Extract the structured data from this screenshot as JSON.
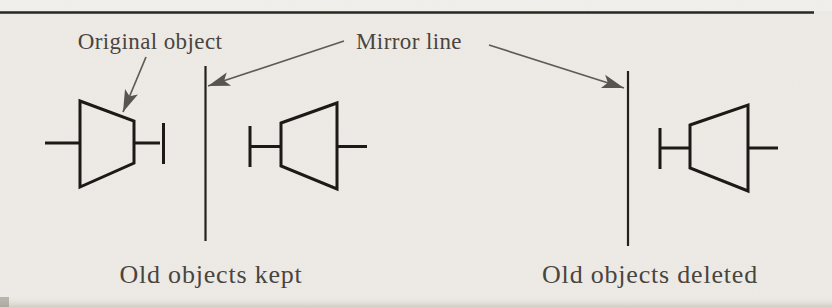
{
  "figure": {
    "annotations": {
      "original_object": "Original object",
      "mirror_line": "Mirror line"
    },
    "captions": {
      "left_panel": "Old objects kept",
      "right_panel": "Old objects deleted"
    },
    "colors": {
      "paper": "#eeebe6",
      "ink": "#181512",
      "mirror_line": "#201d19",
      "arrow": "#5d5952",
      "label_text": "#46423c",
      "top_rule": "#26221d",
      "bottom_shadow": "#d9d4ce"
    }
  }
}
